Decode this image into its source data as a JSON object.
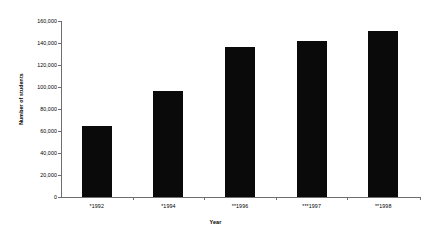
{
  "chart_data": {
    "type": "bar",
    "title": "",
    "xlabel": "Year",
    "ylabel": "Number of students",
    "categories": [
      "*1992",
      "*1994",
      "**1996",
      "***1997",
      "**1998"
    ],
    "values": [
      64500,
      96000,
      136000,
      142000,
      151000
    ],
    "ylim": [
      0,
      160000
    ],
    "ytick_labels": [
      "0",
      "20,000",
      "40,000",
      "60,000",
      "80,000",
      "100,000",
      "120,000",
      "140,000",
      "160,000"
    ],
    "ytick_values": [
      0,
      20000,
      40000,
      60000,
      80000,
      100000,
      120000,
      140000,
      160000
    ],
    "grid": false,
    "legend": null,
    "bar_color": "#0a0a0a",
    "axis_color": "#6e6e6e"
  }
}
